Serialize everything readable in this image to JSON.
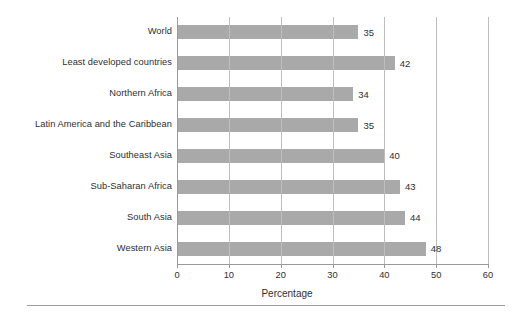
{
  "chart_data": {
    "type": "bar",
    "orientation": "horizontal",
    "title": "",
    "subtitle": "",
    "xlabel": "Percentage",
    "ylabel": "",
    "xlim": [
      0,
      60
    ],
    "xticks": [
      0,
      10,
      20,
      30,
      40,
      50,
      60
    ],
    "xtick_labels": [
      "0",
      "10",
      "20",
      "30",
      "40",
      "50",
      "60"
    ],
    "grid": true,
    "grid_axis": "x",
    "legend": false,
    "legend_position": "none",
    "bar_color": "#a9a9a9",
    "categories": [
      "World",
      "Least developed countries",
      "Northern Africa",
      "Latin America and the Caribbean",
      "Southeast Asia",
      "Sub-Saharan Africa",
      "South Asia",
      "Western Asia"
    ],
    "values": [
      35,
      42,
      34,
      35,
      40,
      43,
      44,
      48
    ],
    "data_labels": [
      "35",
      "42",
      "34",
      "35",
      "40",
      "43",
      "44",
      "48"
    ],
    "series": [
      {
        "name": "Percentage",
        "values": [
          35,
          42,
          34,
          35,
          40,
          43,
          44,
          48
        ]
      }
    ]
  }
}
